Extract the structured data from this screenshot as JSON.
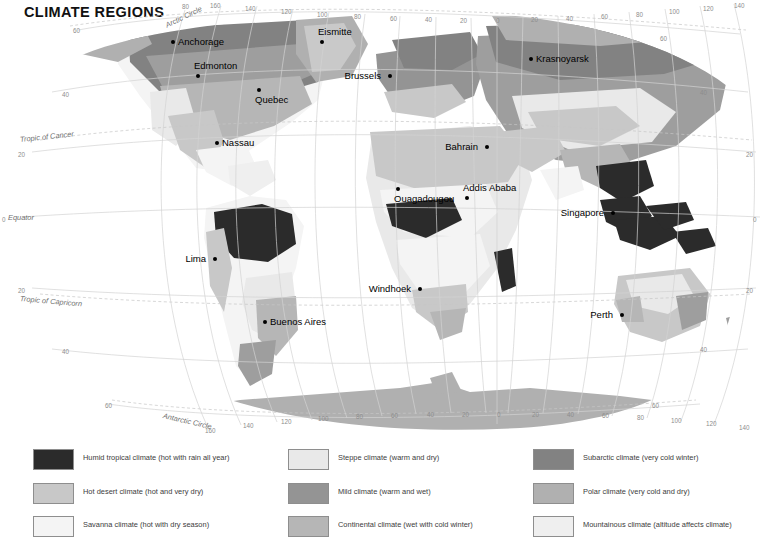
{
  "page": {
    "title": "CLIMATE REGIONS",
    "background": "#ffffff"
  },
  "map": {
    "projection_note": "world map, Robinson-style projection",
    "ocean_color": "#ffffff",
    "graticule_color": "#d2d2d2",
    "named_latitudes": [
      {
        "name": "Arctic Circle",
        "x": 166,
        "y": 22,
        "rot": -26
      },
      {
        "name": "Tropic of Cancer",
        "x": 20,
        "y": 136,
        "rot": -6
      },
      {
        "name": "Equator",
        "x": 8,
        "y": 214,
        "rot": 0
      },
      {
        "name": "Tropic of Capricorn",
        "x": 20,
        "y": 295,
        "rot": 5
      },
      {
        "name": "Antarctic Circle",
        "x": 163,
        "y": 412,
        "rot": 13
      }
    ],
    "latitude_ticks_left": [
      {
        "label": "60",
        "x": 73,
        "y": 28
      },
      {
        "label": "40",
        "x": 62,
        "y": 92
      },
      {
        "label": "20",
        "x": 18,
        "y": 152
      },
      {
        "label": "0",
        "x": 2,
        "y": 217
      },
      {
        "label": "20",
        "x": 18,
        "y": 288
      },
      {
        "label": "40",
        "x": 62,
        "y": 349
      },
      {
        "label": "60",
        "x": 105,
        "y": 403
      }
    ],
    "latitude_ticks_right": [
      {
        "label": "60",
        "x": 660,
        "y": 36
      },
      {
        "label": "40",
        "x": 700,
        "y": 90
      },
      {
        "label": "20",
        "x": 746,
        "y": 152
      },
      {
        "label": "0",
        "x": 753,
        "y": 217
      },
      {
        "label": "20",
        "x": 746,
        "y": 288
      },
      {
        "label": "40",
        "x": 700,
        "y": 347
      },
      {
        "label": "60",
        "x": 652,
        "y": 403
      }
    ],
    "longitude_ticks_top": [
      {
        "label": "80",
        "x": 182,
        "y": 4
      },
      {
        "label": "160",
        "x": 210,
        "y": 3
      },
      {
        "label": "140",
        "x": 245,
        "y": 6
      },
      {
        "label": "120",
        "x": 281,
        "y": 9
      },
      {
        "label": "100",
        "x": 317,
        "y": 12
      },
      {
        "label": "80",
        "x": 354,
        "y": 14
      },
      {
        "label": "60",
        "x": 390,
        "y": 16
      },
      {
        "label": "40",
        "x": 425,
        "y": 17
      },
      {
        "label": "20",
        "x": 460,
        "y": 18
      },
      {
        "label": "0",
        "x": 496,
        "y": 18
      },
      {
        "label": "20",
        "x": 531,
        "y": 17
      },
      {
        "label": "40",
        "x": 566,
        "y": 16
      },
      {
        "label": "60",
        "x": 601,
        "y": 14
      },
      {
        "label": "80",
        "x": 636,
        "y": 12
      },
      {
        "label": "100",
        "x": 669,
        "y": 9
      },
      {
        "label": "120",
        "x": 703,
        "y": 6
      },
      {
        "label": "140",
        "x": 734,
        "y": 3
      }
    ],
    "longitude_ticks_bottom": [
      {
        "label": "160",
        "x": 205,
        "y": 428
      },
      {
        "label": "140",
        "x": 243,
        "y": 423
      },
      {
        "label": "120",
        "x": 281,
        "y": 419
      },
      {
        "label": "100",
        "x": 318,
        "y": 416
      },
      {
        "label": "80",
        "x": 356,
        "y": 414
      },
      {
        "label": "60",
        "x": 391,
        "y": 413
      },
      {
        "label": "40",
        "x": 427,
        "y": 412
      },
      {
        "label": "20",
        "x": 462,
        "y": 412
      },
      {
        "label": "0",
        "x": 497,
        "y": 412
      },
      {
        "label": "20",
        "x": 532,
        "y": 412
      },
      {
        "label": "40",
        "x": 567,
        "y": 412
      },
      {
        "label": "60",
        "x": 602,
        "y": 413
      },
      {
        "label": "80",
        "x": 637,
        "y": 415
      },
      {
        "label": "100",
        "x": 671,
        "y": 418
      },
      {
        "label": "120",
        "x": 706,
        "y": 421
      },
      {
        "label": "140",
        "x": 739,
        "y": 425
      }
    ],
    "cities": [
      {
        "name": "Anchorage",
        "x": 171,
        "y": 40,
        "pos": "r"
      },
      {
        "name": "Eismitte",
        "x": 320,
        "y": 40,
        "pos": "b"
      },
      {
        "name": "Krasnoyarsk",
        "x": 529,
        "y": 57,
        "pos": "r"
      },
      {
        "name": "Edmonton",
        "x": 196,
        "y": 74,
        "pos": "b"
      },
      {
        "name": "Brussels",
        "x": 388,
        "y": 74,
        "pos": "l"
      },
      {
        "name": "Quebec",
        "x": 257,
        "y": 88,
        "pos": "bb"
      },
      {
        "name": "Nassau",
        "x": 215,
        "y": 141,
        "pos": "r"
      },
      {
        "name": "Bahrain",
        "x": 485,
        "y": 145,
        "pos": "l"
      },
      {
        "name": "Ouagadougou",
        "x": 396,
        "y": 187,
        "pos": "bb"
      },
      {
        "name": "Addis Ababa",
        "x": 465,
        "y": 196,
        "pos": "b"
      },
      {
        "name": "Singapore",
        "x": 611,
        "y": 211,
        "pos": "l"
      },
      {
        "name": "Lima",
        "x": 213,
        "y": 257,
        "pos": "l"
      },
      {
        "name": "Windhoek",
        "x": 418,
        "y": 287,
        "pos": "l"
      },
      {
        "name": "Perth",
        "x": 620,
        "y": 313,
        "pos": "l"
      },
      {
        "name": "Buenos Aires",
        "x": 263,
        "y": 320,
        "pos": "r"
      }
    ]
  },
  "legend": {
    "columns": [
      {
        "x": 33,
        "items": [
          {
            "label": "Humid tropical climate (hot with rain all year)",
            "color": "#2b2b2b"
          },
          {
            "label": "Hot desert climate (hot and very dry)",
            "color": "#c8c8c8"
          },
          {
            "label": "Savanna climate (hot with dry season)",
            "color": "#f4f4f4"
          }
        ]
      },
      {
        "x": 288,
        "items": [
          {
            "label": "Steppe climate (warm and dry)",
            "color": "#e9e9e9"
          },
          {
            "label": "Mild climate (warm and wet)",
            "color": "#949494"
          },
          {
            "label": "Continental climate (wet with cold winter)",
            "color": "#b6b6b6"
          }
        ]
      },
      {
        "x": 533,
        "items": [
          {
            "label": "Subarctic climate (very cold winter)",
            "color": "#828282"
          },
          {
            "label": "Polar climate (very cold and dry)",
            "color": "#b0b0b0"
          },
          {
            "label": "Mountainous climate (altitude affects climate)",
            "color": "#efefef"
          }
        ]
      }
    ],
    "row_y": [
      12,
      46,
      79
    ]
  }
}
